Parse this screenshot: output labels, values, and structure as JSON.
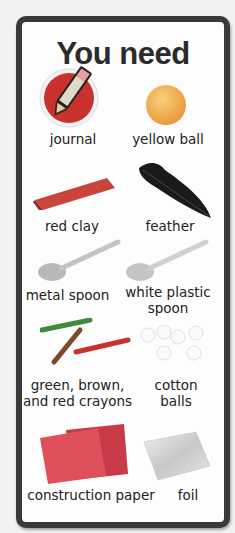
{
  "card": {
    "title": "You need"
  },
  "items": [
    {
      "label": "journal",
      "icon": "journal-pencil-icon",
      "color": "#c8322d"
    },
    {
      "label": "yellow ball",
      "icon": "ball-icon",
      "color": "#f2b24a"
    },
    {
      "label": "red clay",
      "icon": "clay-bar-icon",
      "color": "#c9443a"
    },
    {
      "label": "feather",
      "icon": "feather-icon",
      "color": "#1a1a1a"
    },
    {
      "label": "metal spoon",
      "icon": "metal-spoon-icon",
      "color": "#b8b8b8"
    },
    {
      "label": "white plastic",
      "label2": "spoon",
      "icon": "plastic-spoon-icon",
      "color": "#c4c4c4"
    },
    {
      "label": "green, brown,",
      "label2": "and red crayons",
      "icon": "crayons-icon",
      "colors": [
        "#3f8a3c",
        "#7a4a2a",
        "#c8322d"
      ]
    },
    {
      "label": "cotton",
      "label2": "balls",
      "icon": "cotton-balls-icon",
      "color": "#ffffff"
    },
    {
      "label": "construction paper",
      "icon": "construction-paper-icon",
      "colors": [
        "#e0505a",
        "#c93a48"
      ]
    },
    {
      "label": "foil",
      "icon": "foil-icon",
      "color": "#d4d4d4"
    }
  ]
}
